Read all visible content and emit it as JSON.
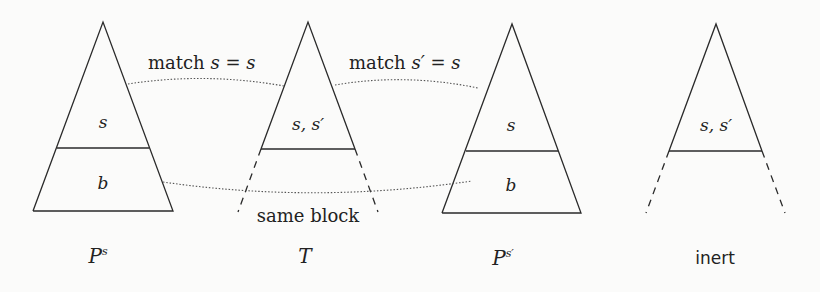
{
  "diagram": {
    "trees": [
      {
        "id": "ps",
        "caption_main": "P",
        "caption_sup": "s",
        "upper_label": "s",
        "lower_label": "b",
        "style": "solid-full"
      },
      {
        "id": "t",
        "caption_main": "T",
        "caption_sup": "",
        "upper_label": "s, s′",
        "lower_label": "",
        "style": "solid-top-dashed-bottom"
      },
      {
        "id": "psprime",
        "caption_main": "P",
        "caption_sup": "s′",
        "upper_label": "s",
        "lower_label": "b",
        "style": "solid-full"
      },
      {
        "id": "inert",
        "caption_main": "inert",
        "caption_sup": "",
        "upper_label": "s, s′",
        "lower_label": "",
        "style": "solid-top-dashed-bottom"
      }
    ],
    "connections": [
      {
        "from": "ps",
        "to": "t",
        "label_prefix": "match ",
        "label_math": "s = s"
      },
      {
        "from": "t",
        "to": "psprime",
        "label_prefix": "match ",
        "label_math": "s′ = s"
      },
      {
        "from": "ps",
        "to": "psprime",
        "label_prefix": "same block",
        "label_math": ""
      }
    ]
  }
}
